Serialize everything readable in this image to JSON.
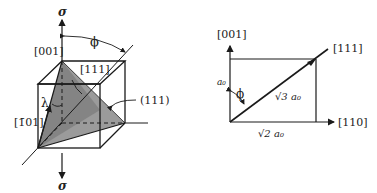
{
  "left_figure": {
    "stress_top_label": "σ",
    "stress_bottom_label": "σ",
    "direction_001": "[001]",
    "angle_phi": "ϕ",
    "direction_111": "[111]",
    "angle_lambda": "λ",
    "direction_m101": "[1̄01]",
    "plane_111": "(111)"
  },
  "right_figure": {
    "axis_001": "[001]",
    "direction_111": "[111]",
    "axis_110": "[110]",
    "side_a0": "a₀",
    "angle_phi": "ϕ",
    "diagonal_label": "√3 a₀",
    "base_label": "√2 a₀"
  },
  "colors": {
    "line": "#1a1a1a",
    "plane_fill": "#8a8a8a"
  }
}
